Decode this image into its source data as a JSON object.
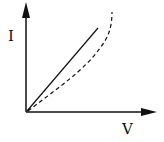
{
  "diagram": {
    "type": "I-V characteristic",
    "axes": {
      "y_label": "I",
      "x_label": "V"
    },
    "curves": [
      {
        "name": "linear",
        "style": "solid",
        "description": "straight line through origin"
      },
      {
        "name": "nonlinear",
        "style": "dashed",
        "description": "curve through origin bending upward at high V"
      }
    ],
    "colors": {
      "ink": "#111111",
      "background": "#ffffff"
    }
  }
}
